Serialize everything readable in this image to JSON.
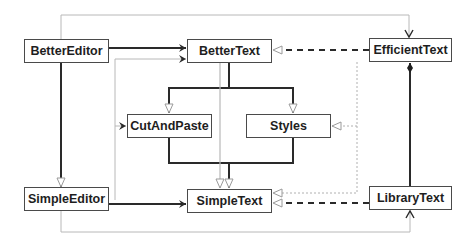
{
  "diagram": {
    "type": "UML class diagram",
    "classes": [
      {
        "id": "BetterEditor",
        "label": "BetterEditor"
      },
      {
        "id": "BetterText",
        "label": "BetterText"
      },
      {
        "id": "EfficientText",
        "label": "EfficientText"
      },
      {
        "id": "CutAndPaste",
        "label": "CutAndPaste"
      },
      {
        "id": "Styles",
        "label": "Styles"
      },
      {
        "id": "SimpleEditor",
        "label": "SimpleEditor"
      },
      {
        "id": "SimpleText",
        "label": "SimpleText"
      },
      {
        "id": "LibraryText",
        "label": "LibraryText"
      }
    ],
    "relationships": [
      {
        "from": "BetterEditor",
        "to": "BetterText",
        "kind": "association",
        "style": "solid-dark"
      },
      {
        "from": "BetterEditor",
        "to": "SimpleEditor",
        "kind": "generalization",
        "style": "solid-dark"
      },
      {
        "from": "SimpleEditor",
        "to": "SimpleText",
        "kind": "association",
        "style": "solid-dark"
      },
      {
        "from": "BetterText",
        "to": "CutAndPaste",
        "kind": "generalization",
        "style": "solid-dark"
      },
      {
        "from": "BetterText",
        "to": "Styles",
        "kind": "generalization",
        "style": "solid-dark"
      },
      {
        "from": "CutAndPaste",
        "to": "SimpleText",
        "kind": "generalization",
        "style": "solid-dark"
      },
      {
        "from": "Styles",
        "to": "SimpleText",
        "kind": "generalization",
        "style": "solid-dark"
      },
      {
        "from": "BetterText",
        "to": "SimpleText",
        "kind": "generalization",
        "style": "solid-light"
      },
      {
        "from": "EfficientText",
        "to": "BetterText",
        "kind": "realization",
        "style": "dashed-dark"
      },
      {
        "from": "LibraryText",
        "to": "SimpleText",
        "kind": "realization",
        "style": "dashed-dark"
      },
      {
        "from": "EfficientText",
        "to": "Styles",
        "kind": "realization",
        "style": "dotted-light"
      },
      {
        "from": "EfficientText",
        "to": "SimpleText",
        "kind": "realization",
        "style": "dotted-light"
      },
      {
        "from": "LibraryText",
        "to": "EfficientText",
        "kind": "composition",
        "style": "solid-dark"
      },
      {
        "from": "BetterEditor",
        "to": "EfficientText",
        "kind": "association",
        "style": "solid-light"
      },
      {
        "from": "SimpleEditor",
        "to": "LibraryText",
        "kind": "association",
        "style": "solid-light"
      },
      {
        "from": "SimpleEditor",
        "to": "BetterText",
        "kind": "association",
        "style": "solid-light"
      },
      {
        "from": "SimpleEditor",
        "to": "CutAndPaste",
        "kind": "association",
        "style": "solid-light"
      }
    ],
    "colors": {
      "dark_line": "#2a2a2a",
      "light_line": "#b8b8b8",
      "box_border": "#4a4a4a",
      "text": "#1e1e1e",
      "background": "#ffffff"
    }
  }
}
